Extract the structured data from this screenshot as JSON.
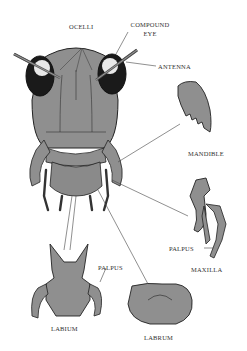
{
  "diagram": {
    "labels": {
      "ocelli": "OCELLI",
      "compound_eye_line1": "COMPOUND",
      "compound_eye_line2": "EYE",
      "antenna": "ANTENNA",
      "mandible": "MANDIBLE",
      "palpus_maxilla": "PALPUS",
      "maxilla": "MAXILLA",
      "palpus_labium": "PALPUS",
      "labium": "LABIUM",
      "labrum": "LABRUM"
    },
    "colors": {
      "body_fill": "#8f8f8f",
      "outline": "#222222",
      "eye_dark": "#1a1a1a",
      "leader_line": "#444444",
      "background": "#ffffff"
    }
  }
}
